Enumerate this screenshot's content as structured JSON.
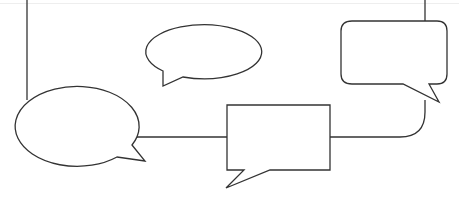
{
  "diagram": {
    "type": "connected speech bubbles",
    "stroke_color": "#333333",
    "fill_color": "#ffffff",
    "nodes": [
      {
        "id": "oval-top-center",
        "shape": "oval speech bubble",
        "tail": "bottom-left"
      },
      {
        "id": "rounded-rect-top-right",
        "shape": "rounded rectangle speech bubble",
        "tail": "bottom-right"
      },
      {
        "id": "oval-left",
        "shape": "oval speech bubble",
        "tail": "bottom-right"
      },
      {
        "id": "rect-center",
        "shape": "rectangle speech bubble",
        "tail": "bottom-left"
      }
    ],
    "connectors": [
      {
        "from": "top-edge",
        "to": "oval-left"
      },
      {
        "from": "oval-left",
        "to": "rect-center"
      },
      {
        "from": "rect-center",
        "to": "rounded-rect-top-right"
      },
      {
        "from": "top-edge",
        "to": "rounded-rect-top-right"
      }
    ]
  }
}
